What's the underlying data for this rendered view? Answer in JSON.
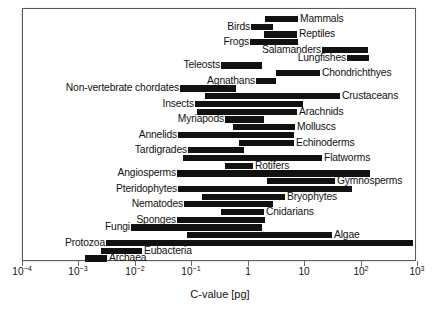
{
  "chart_data": {
    "type": "bar",
    "orientation": "horizontal-range",
    "title": "",
    "xlabel": "C-value [pg]",
    "ylabel": "",
    "xscale": "log",
    "xlim": [
      0.0001,
      1000
    ],
    "grid": false,
    "legend": null,
    "tick_labels": [
      "10−4",
      "10−3",
      "10−2",
      "10−1",
      "1",
      "10",
      "10²",
      "10³"
    ],
    "tick_values": [
      0.0001,
      0.001,
      0.01,
      0.1,
      1,
      10,
      100,
      1000
    ],
    "bar_color": "#111111",
    "categories": [
      "Mammals",
      "Birds",
      "Reptiles",
      "Frogs",
      "Salamanders",
      "Lungfishes",
      "Teleosts",
      "Chondrichthyes",
      "Agnathans",
      "Non-vertebrate chordates",
      "Crustaceans",
      "Insects",
      "Arachnids",
      "Myriapods",
      "Molluscs",
      "Annelids",
      "Echinoderms",
      "Tardigrades",
      "Flatworms",
      "Rotifers",
      "Angiosperms",
      "Gymnosperms",
      "Pteridophytes",
      "Bryophytes",
      "Nematodes",
      "Cnidarians",
      "Sponges",
      "Fungi",
      "Algae",
      "Protozoa",
      "Eubacteria",
      "Archaea"
    ],
    "ranges": [
      {
        "name": "Mammals",
        "min": 1.73,
        "max": 8.4,
        "label_side": "right",
        "row": 0,
        "x0": 265,
        "x1": 298
      },
      {
        "name": "Birds",
        "min": 0.97,
        "max": 2.16,
        "label_side": "left",
        "row": 1,
        "x0": 251,
        "x1": 273
      },
      {
        "name": "Reptiles",
        "min": 1.3,
        "max": 5.4,
        "label_side": "right",
        "row": 2,
        "x0": 264,
        "x1": 297
      },
      {
        "name": "Frogs",
        "min": 0.95,
        "max": 8.9,
        "label_side": "left",
        "row": 3,
        "x0": 250,
        "x1": 298
      },
      {
        "name": "Salamanders",
        "min": 13.5,
        "max": 92,
        "label_side": "left",
        "row": 4,
        "x0": 322,
        "x1": 368
      },
      {
        "name": "Lungfishes",
        "min": 40,
        "max": 95,
        "label_side": "left",
        "row": 5,
        "x0": 347,
        "x1": 369
      },
      {
        "name": "Teleosts",
        "min": 0.35,
        "max": 4.4,
        "label_side": "left",
        "row": 6,
        "x0": 221,
        "x1": 262
      },
      {
        "name": "Chondrichthyes",
        "min": 1.5,
        "max": 17.0,
        "label_side": "right",
        "row": 7,
        "x0": 276,
        "x1": 320
      },
      {
        "name": "Agnathans",
        "min": 0.75,
        "max": 2.9,
        "label_side": "left",
        "row": 8,
        "x0": 256,
        "x1": 276
      },
      {
        "name": "Non-vertebrate chordates",
        "min": 0.06,
        "max": 1.0,
        "label_side": "left",
        "row": 9,
        "x0": 180,
        "x1": 236
      },
      {
        "name": "Crustaceans",
        "min": 0.14,
        "max": 40,
        "label_side": "right",
        "row": 10,
        "x0": 205,
        "x1": 340
      },
      {
        "name": "Insects",
        "min": 0.1,
        "max": 6.8,
        "label_side": "left",
        "row": 11,
        "x0": 195,
        "x1": 303
      },
      {
        "name": "Arachnids",
        "min": 0.11,
        "max": 5.4,
        "label_side": "right",
        "row": 12,
        "x0": 197,
        "x1": 297
      },
      {
        "name": "Myriapods",
        "min": 0.4,
        "max": 5.0,
        "label_side": "left",
        "row": 13,
        "x0": 225,
        "x1": 264
      },
      {
        "name": "Molluscs",
        "min": 0.48,
        "max": 5.4,
        "label_side": "right",
        "row": 14,
        "x0": 233,
        "x1": 295
      },
      {
        "name": "Annelids",
        "min": 0.057,
        "max": 5.1,
        "label_side": "left",
        "row": 15,
        "x0": 178,
        "x1": 294
      },
      {
        "name": "Echinoderms",
        "min": 0.54,
        "max": 5.1,
        "label_side": "right",
        "row": 16,
        "x0": 239,
        "x1": 294
      },
      {
        "name": "Tardigrades",
        "min": 0.08,
        "max": 0.8,
        "label_side": "left",
        "row": 17,
        "x0": 188,
        "x1": 244
      },
      {
        "name": "Flatworms",
        "min": 0.06,
        "max": 20,
        "label_side": "right",
        "row": 18,
        "x0": 183,
        "x1": 322
      },
      {
        "name": "Rotifers",
        "min": 0.4,
        "max": 1.3,
        "label_side": "right",
        "row": 19,
        "x0": 225,
        "x1": 253
      },
      {
        "name": "Angiosperms",
        "min": 0.05,
        "max": 128,
        "label_side": "left",
        "row": 20,
        "x0": 177,
        "x1": 370
      },
      {
        "name": "Gymnosperms",
        "min": 2.2,
        "max": 33,
        "label_side": "right",
        "row": 21,
        "x0": 267,
        "x1": 335
      },
      {
        "name": "Pteridophytes",
        "min": 0.057,
        "max": 58,
        "label_side": "left",
        "row": 22,
        "x0": 178,
        "x1": 352
      },
      {
        "name": "Bryophytes",
        "min": 0.17,
        "max": 4.3,
        "label_side": "right",
        "row": 23,
        "x0": 202,
        "x1": 285
      },
      {
        "name": "Nematodes",
        "min": 0.07,
        "max": 2.5,
        "label_side": "left",
        "row": 24,
        "x0": 184,
        "x1": 273
      },
      {
        "name": "Cnidarians",
        "min": 0.34,
        "max": 5.0,
        "label_side": "right",
        "row": 25,
        "x0": 221,
        "x1": 264
      },
      {
        "name": "Sponges",
        "min": 0.05,
        "max": 1.9,
        "label_side": "left",
        "row": 26,
        "x0": 177,
        "x1": 265
      },
      {
        "name": "Fungi",
        "min": 0.0096,
        "max": 1.6,
        "label_side": "left",
        "row": 27,
        "x0": 131,
        "x1": 262
      },
      {
        "name": "Algae",
        "min": 0.09,
        "max": 80,
        "label_side": "right",
        "row": 28,
        "x0": 187,
        "x1": 332
      },
      {
        "name": "Protozoa",
        "min": 0.0033,
        "max": 700,
        "label_side": "left",
        "row": 29,
        "x0": 106,
        "x1": 413
      },
      {
        "name": "Eubacteria",
        "min": 0.0025,
        "max": 0.012,
        "label_side": "right",
        "row": 30,
        "x0": 101,
        "x1": 142
      },
      {
        "name": "Archaea",
        "min": 0.0008,
        "max": 0.0033,
        "label_side": "right",
        "row": 31,
        "x0": 85,
        "x1": 107
      }
    ]
  },
  "axis": {
    "title": "C-value [pg]",
    "ticks": [
      {
        "mantissa": "10",
        "exponent": "−4",
        "x": 22
      },
      {
        "mantissa": "10",
        "exponent": "−3",
        "x": 78
      },
      {
        "mantissa": "10",
        "exponent": "−2",
        "x": 135
      },
      {
        "mantissa": "10",
        "exponent": "−1",
        "x": 191
      },
      {
        "mantissa": "1",
        "exponent": "",
        "x": 248
      },
      {
        "mantissa": "10",
        "exponent": "",
        "x": 304
      },
      {
        "mantissa": "10",
        "exponent": "2",
        "x": 361
      },
      {
        "mantissa": "10",
        "exponent": "3",
        "x": 417
      }
    ]
  },
  "layout": {
    "plot_left": 22,
    "plot_top": 8,
    "plot_width": 394,
    "plot_height": 253,
    "row_top": 13,
    "row_step": 7.72
  }
}
